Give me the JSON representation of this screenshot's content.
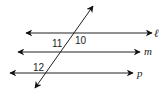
{
  "diagram": {
    "type": "parallel-lines-transversal",
    "lines": [
      {
        "name": "ℓ",
        "y": 33,
        "x1": 26,
        "x2": 152
      },
      {
        "name": "m",
        "y": 52,
        "x1": 18,
        "x2": 140
      },
      {
        "name": "p",
        "y": 73,
        "x1": 10,
        "x2": 133
      }
    ],
    "transversal": {
      "x1": 35,
      "y1": 88,
      "x2": 93,
      "y2": 6
    },
    "angle_labels": [
      {
        "text": "10",
        "x": 77,
        "y": 44
      },
      {
        "text": "11",
        "x": 53,
        "y": 47
      },
      {
        "text": "12",
        "x": 34,
        "y": 71
      }
    ],
    "stroke_color": "#222222"
  }
}
